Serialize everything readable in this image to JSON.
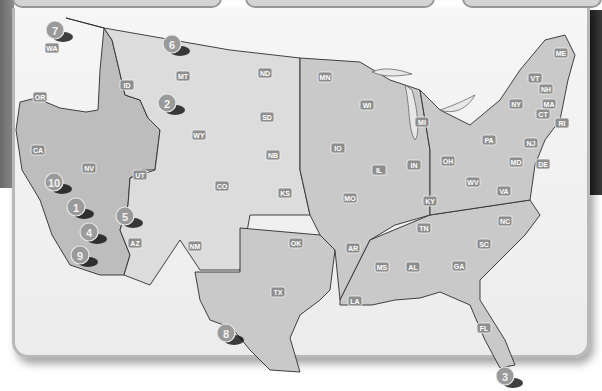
{
  "map": {
    "title": "United States map with numbered locations",
    "states": [
      {
        "abbr": "WA",
        "x": 52,
        "y": 48
      },
      {
        "abbr": "OR",
        "x": 40,
        "y": 97
      },
      {
        "abbr": "CA",
        "x": 38,
        "y": 150
      },
      {
        "abbr": "NV",
        "x": 89,
        "y": 168
      },
      {
        "abbr": "ID",
        "x": 127,
        "y": 85
      },
      {
        "abbr": "MT",
        "x": 183,
        "y": 76
      },
      {
        "abbr": "WY",
        "x": 199,
        "y": 135
      },
      {
        "abbr": "UT",
        "x": 140,
        "y": 175
      },
      {
        "abbr": "AZ",
        "x": 135,
        "y": 243
      },
      {
        "abbr": "CO",
        "x": 222,
        "y": 186
      },
      {
        "abbr": "NM",
        "x": 195,
        "y": 246
      },
      {
        "abbr": "ND",
        "x": 265,
        "y": 73
      },
      {
        "abbr": "SD",
        "x": 267,
        "y": 117
      },
      {
        "abbr": "NB",
        "x": 273,
        "y": 155
      },
      {
        "abbr": "KS",
        "x": 285,
        "y": 193
      },
      {
        "abbr": "OK",
        "x": 296,
        "y": 243
      },
      {
        "abbr": "TX",
        "x": 278,
        "y": 292
      },
      {
        "abbr": "MN",
        "x": 325,
        "y": 77
      },
      {
        "abbr": "IO",
        "x": 338,
        "y": 148
      },
      {
        "abbr": "MO",
        "x": 350,
        "y": 198
      },
      {
        "abbr": "AR",
        "x": 353,
        "y": 248
      },
      {
        "abbr": "LA",
        "x": 355,
        "y": 301
      },
      {
        "abbr": "WI",
        "x": 367,
        "y": 105
      },
      {
        "abbr": "IL",
        "x": 379,
        "y": 170
      },
      {
        "abbr": "MS",
        "x": 382,
        "y": 267
      },
      {
        "abbr": "MI",
        "x": 422,
        "y": 122
      },
      {
        "abbr": "IN",
        "x": 414,
        "y": 165
      },
      {
        "abbr": "KY",
        "x": 430,
        "y": 201
      },
      {
        "abbr": "TN",
        "x": 424,
        "y": 228
      },
      {
        "abbr": "AL",
        "x": 413,
        "y": 267
      },
      {
        "abbr": "OH",
        "x": 448,
        "y": 161
      },
      {
        "abbr": "WV",
        "x": 473,
        "y": 182
      },
      {
        "abbr": "GA",
        "x": 459,
        "y": 266
      },
      {
        "abbr": "FL",
        "x": 484,
        "y": 328
      },
      {
        "abbr": "SC",
        "x": 484,
        "y": 244
      },
      {
        "abbr": "NC",
        "x": 505,
        "y": 221
      },
      {
        "abbr": "VA",
        "x": 504,
        "y": 191
      },
      {
        "abbr": "PA",
        "x": 489,
        "y": 140
      },
      {
        "abbr": "NY",
        "x": 516,
        "y": 104
      },
      {
        "abbr": "MD",
        "x": 516,
        "y": 162
      },
      {
        "abbr": "DE",
        "x": 543,
        "y": 164
      },
      {
        "abbr": "NJ",
        "x": 531,
        "y": 143
      },
      {
        "abbr": "VT",
        "x": 535,
        "y": 78
      },
      {
        "abbr": "NH",
        "x": 546,
        "y": 89
      },
      {
        "abbr": "ME",
        "x": 561,
        "y": 53
      },
      {
        "abbr": "MA",
        "x": 549,
        "y": 104
      },
      {
        "abbr": "CT",
        "x": 543,
        "y": 114
      },
      {
        "abbr": "RI",
        "x": 562,
        "y": 123
      }
    ],
    "markers": [
      {
        "num": "1",
        "x": 76,
        "y": 207
      },
      {
        "num": "2",
        "x": 167,
        "y": 103
      },
      {
        "num": "3",
        "x": 505,
        "y": 376
      },
      {
        "num": "4",
        "x": 89,
        "y": 232
      },
      {
        "num": "5",
        "x": 125,
        "y": 216
      },
      {
        "num": "6",
        "x": 172,
        "y": 44
      },
      {
        "num": "7",
        "x": 55,
        "y": 30
      },
      {
        "num": "8",
        "x": 226,
        "y": 333
      },
      {
        "num": "9",
        "x": 80,
        "y": 255
      },
      {
        "num": "10",
        "x": 54,
        "y": 182
      }
    ]
  },
  "colors": {
    "land": "#c9c9c9",
    "border": "#2e2e2e",
    "marker": "#9a9a9a",
    "label_bg": "#8e8e8e"
  }
}
